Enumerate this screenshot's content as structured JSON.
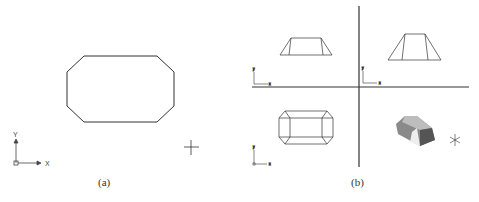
{
  "figure": {
    "panels": [
      {
        "caption": "(a)",
        "shape": "octagon",
        "ucs_icon": {
          "x_label": "X",
          "y_label": "Y"
        },
        "cursor": "crosshair"
      },
      {
        "caption": "(b)",
        "viewports": [
          {
            "position": "top-left",
            "view": "front",
            "ucs_icon": {
              "x_label": "x",
              "y_label": "y"
            }
          },
          {
            "position": "top-right",
            "view": "side",
            "ucs_icon": {
              "x_label": "x",
              "y_label": "y"
            }
          },
          {
            "position": "bottom-left",
            "view": "top",
            "ucs_icon": {
              "x_label": "x",
              "y_label": "y"
            }
          },
          {
            "position": "bottom-right",
            "view": "shaded-isometric"
          }
        ]
      }
    ]
  },
  "colors": {
    "line": "#333333",
    "background": "#ffffff",
    "shade_dark": "#555555",
    "shade_light": "#bbbbbb"
  }
}
